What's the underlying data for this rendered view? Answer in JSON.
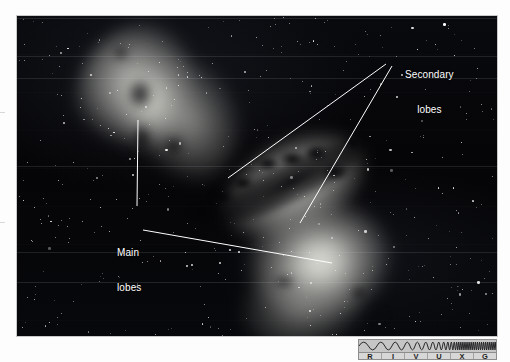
{
  "figure": {
    "kind": "astronomy-photograph",
    "background_color": "#050508",
    "annotation_color": "#ffffff"
  },
  "annotations": [
    {
      "id": "secondary-lobes",
      "line1": "Secondary",
      "line2": "lobes",
      "x": 388,
      "y": 30,
      "leaders": [
        {
          "from": [
            386,
            64
          ],
          "to": [
            228,
            178
          ]
        },
        {
          "from": [
            392,
            66
          ],
          "to": [
            300,
            223
          ]
        }
      ]
    },
    {
      "id": "main-lobes",
      "line1": "Main",
      "line2": "lobes",
      "x": 100,
      "y": 208,
      "leaders": [
        {
          "from": [
            138,
            120
          ],
          "to": [
            137,
            206
          ]
        },
        {
          "from": [
            143,
            230
          ],
          "to": [
            332,
            263
          ]
        }
      ]
    }
  ],
  "spectrum_key": {
    "name": "RIVUXG wavelength indicator",
    "highlighted": "R",
    "bands": [
      {
        "letter": "R",
        "meaning": "Radio"
      },
      {
        "letter": "I",
        "meaning": "Infrared"
      },
      {
        "letter": "V",
        "meaning": "Visible"
      },
      {
        "letter": "U",
        "meaning": "Ultraviolet"
      },
      {
        "letter": "X",
        "meaning": "X-ray"
      },
      {
        "letter": "G",
        "meaning": "Gamma ray"
      }
    ],
    "border_color": "#8d8d8d",
    "fill_color": "#cfcfcf"
  }
}
